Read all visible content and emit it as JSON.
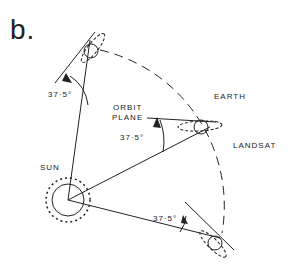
{
  "panel_label": "b.",
  "labels": {
    "earth": "EARTH",
    "landsat": "LANDSAT",
    "sun": "SUN",
    "orbit_plane_line1": "ORBIT",
    "orbit_plane_line2": "PLANE",
    "angle_top": "37·5°",
    "angle_mid": "37·5°",
    "angle_bottom": "37·5°"
  },
  "colors": {
    "ink": "#222222",
    "background": "#ffffff"
  }
}
